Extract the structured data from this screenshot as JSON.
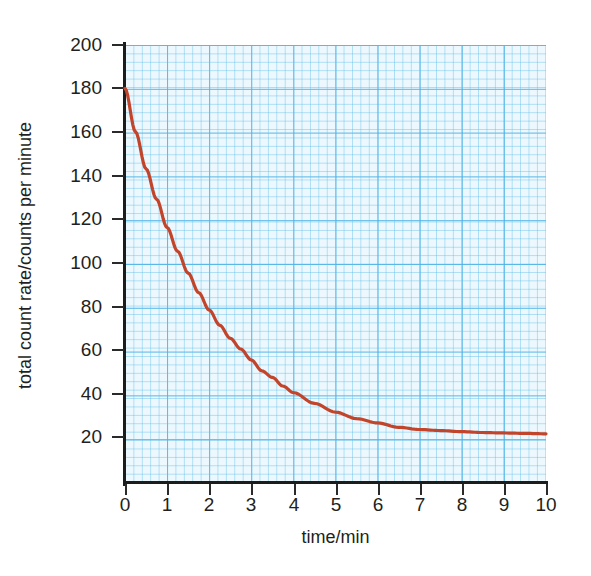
{
  "chart_data": {
    "type": "line",
    "title": "",
    "xlabel": "time/min",
    "ylabel": "total count rate/counts per minute",
    "xlim": [
      0,
      10
    ],
    "ylim": [
      0,
      200
    ],
    "xticks": [
      "0",
      "1",
      "2",
      "3",
      "4",
      "5",
      "6",
      "7",
      "8",
      "9",
      "10"
    ],
    "yticks": [
      "200",
      "180",
      "160",
      "140",
      "120",
      "100",
      "80",
      "60",
      "40",
      "20"
    ],
    "grid": true,
    "grid_style": "graph-paper",
    "legend": "none",
    "series": [
      {
        "name": "total count rate",
        "color": "#c2452b",
        "x": [
          0,
          0.25,
          0.5,
          0.75,
          1.0,
          1.25,
          1.5,
          1.75,
          2.0,
          2.25,
          2.5,
          2.75,
          3.0,
          3.25,
          3.5,
          3.75,
          4.0,
          4.5,
          5.0,
          5.5,
          6.0,
          6.5,
          7.0,
          7.5,
          8.0,
          8.5,
          9.0,
          9.5,
          10.0
        ],
        "y": [
          180,
          160,
          143,
          129,
          116,
          105,
          95,
          86,
          78,
          71,
          65,
          60,
          55,
          50,
          47,
          43,
          40,
          35,
          31,
          28,
          26,
          24,
          23,
          22.5,
          22,
          21.6,
          21.4,
          21.2,
          21
        ]
      }
    ],
    "annotations": {
      "initial_count_rate": 180,
      "background_level": 21,
      "asymptote": "curve levels off at about 21 counts per minute"
    }
  },
  "axes": {
    "y_tick_labels": [
      "200",
      "180",
      "160",
      "140",
      "120",
      "100",
      "80",
      "60",
      "40",
      "20"
    ],
    "x_tick_labels": [
      "0",
      "1",
      "2",
      "3",
      "4",
      "5",
      "6",
      "7",
      "8",
      "9",
      "10"
    ],
    "y_title": "total count rate/counts per minute",
    "x_title": "time/min"
  },
  "colors": {
    "curve": "#c2452b",
    "grid_minor": "#9fd8f0",
    "grid_major": "#44b0e1",
    "plot_background": "#ecf8fd",
    "axis": "#1c1c1c",
    "page_background": "#fdf6d9",
    "card_background": "#ffffff",
    "text": "#231f20"
  }
}
